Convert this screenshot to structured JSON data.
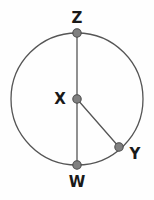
{
  "figure": {
    "background_color": "#fefefe",
    "stroke_color": "#555555",
    "point_fill_color": "#808080",
    "point_stroke_color": "#4a4a4a",
    "label_color": "#191919",
    "circle": {
      "center_x": 77,
      "center_y": 99,
      "radius": 66,
      "stroke_width": 1.3
    },
    "points": [
      {
        "id": "Z",
        "label": "Z",
        "role": "point-on-circle-top",
        "cx": 77,
        "cy": 33,
        "r": 4.2,
        "label_x": 77,
        "label_y": 18
      },
      {
        "id": "X",
        "label": "X",
        "role": "circle-center",
        "cx": 77,
        "cy": 99,
        "r": 4.2,
        "label_x": 60,
        "label_y": 99
      },
      {
        "id": "Y",
        "label": "Y",
        "role": "point-on-circle-lower-right",
        "cx": 119,
        "cy": 147,
        "r": 4.2,
        "label_x": 135,
        "label_y": 154
      },
      {
        "id": "W",
        "label": "W",
        "role": "point-on-circle-bottom",
        "cx": 77,
        "cy": 165,
        "r": 4.2,
        "label_x": 77,
        "label_y": 182
      }
    ],
    "segments": [
      {
        "id": "XZ",
        "name": "radius-xz",
        "x1": 77,
        "y1": 99,
        "x2": 77,
        "y2": 33
      },
      {
        "id": "XW",
        "name": "radius-xw",
        "x1": 77,
        "y1": 99,
        "x2": 77,
        "y2": 165
      },
      {
        "id": "XY",
        "name": "radius-xy",
        "x1": 77,
        "y1": 99,
        "x2": 119,
        "y2": 147
      }
    ]
  }
}
